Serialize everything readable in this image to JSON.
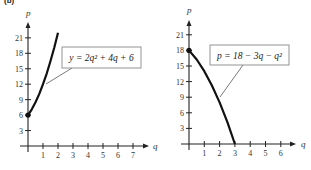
{
  "part_label": "(b)",
  "chart_data": [
    {
      "type": "line",
      "title": "",
      "xlabel": "q",
      "ylabel": "p",
      "equation_label": "y = 2q² + 4q + 6",
      "x_ticks": [
        1,
        2,
        3,
        4,
        5,
        6,
        7
      ],
      "y_ticks": [
        3,
        6,
        9,
        12,
        15,
        18,
        21
      ],
      "xlim": [
        0,
        7.8
      ],
      "ylim": [
        0,
        23
      ],
      "grid": false,
      "x": [
        0,
        0.25,
        0.5,
        0.75,
        1,
        1.25,
        1.5,
        1.75,
        2
      ],
      "values": [
        6,
        7.125,
        8.5,
        10.125,
        12,
        14.125,
        16.5,
        19.125,
        22
      ],
      "endpoint_marker": {
        "q": 0,
        "p": 6
      }
    },
    {
      "type": "line",
      "title": "",
      "xlabel": "q",
      "ylabel": "p",
      "equation_label": "p = 18 − 3q − q²",
      "x_ticks": [
        1,
        2,
        3,
        4,
        5,
        6
      ],
      "y_ticks": [
        3,
        6,
        9,
        12,
        15,
        18,
        21
      ],
      "xlim": [
        0,
        6.8
      ],
      "ylim": [
        0,
        23
      ],
      "grid": false,
      "x": [
        0,
        0.5,
        1,
        1.5,
        2,
        2.5,
        3
      ],
      "values": [
        18,
        16.25,
        14,
        11.25,
        8,
        4.25,
        0
      ],
      "endpoint_marker": {
        "q": 0,
        "p": 18
      }
    }
  ]
}
